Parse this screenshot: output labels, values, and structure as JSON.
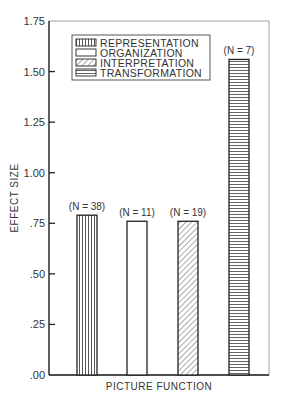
{
  "chart_data": {
    "type": "bar",
    "title": "",
    "xlabel": "PICTURE FUNCTION",
    "ylabel": "EFFECT SIZE",
    "ylim": [
      0,
      1.75
    ],
    "yticks": [
      ".00",
      ".25",
      ".50",
      ".75",
      "1.00",
      "1.25",
      "1.50",
      "1.75"
    ],
    "grid": false,
    "legend_position": "upper-left",
    "categories": [
      "REPRESENTATION",
      "ORGANIZATION",
      "INTERPRETATION",
      "TRANSFORMATION"
    ],
    "values": [
      0.79,
      0.76,
      0.76,
      1.56
    ],
    "annotations": [
      "(N = 38)",
      "(N = 11)",
      "(N = 19)",
      "(N = 7)"
    ],
    "patterns": [
      "vertical-lines",
      "blank",
      "diagonal-lines",
      "horizontal-lines"
    ]
  }
}
